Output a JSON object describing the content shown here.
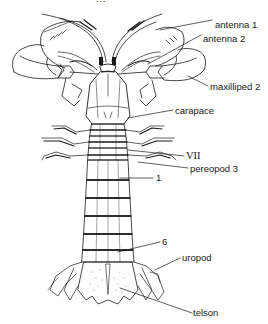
{
  "figure": {
    "title_fragment": "...",
    "line_color": "#1a1a1a",
    "background": "#ffffff"
  },
  "labels": [
    {
      "id": "antenna1",
      "text": "antenna  1",
      "x": 215,
      "y": 25
    },
    {
      "id": "antenna2",
      "text": "antenna  2",
      "x": 203,
      "y": 39
    },
    {
      "id": "maxilliped2",
      "text": "maxilliped  2",
      "x": 210,
      "y": 88
    },
    {
      "id": "carapace",
      "text": "carapace",
      "x": 175,
      "y": 113
    },
    {
      "id": "vii",
      "text": "VII",
      "x": 186,
      "y": 158
    },
    {
      "id": "pereopod3",
      "text": "pereopod  3",
      "x": 190,
      "y": 170
    },
    {
      "id": "somite1",
      "text": "1",
      "x": 156,
      "y": 180
    },
    {
      "id": "somite6",
      "text": "6",
      "x": 162,
      "y": 244
    },
    {
      "id": "uropod",
      "text": "uropod",
      "x": 182,
      "y": 260
    },
    {
      "id": "telson",
      "text": "telson",
      "x": 193,
      "y": 315
    }
  ]
}
